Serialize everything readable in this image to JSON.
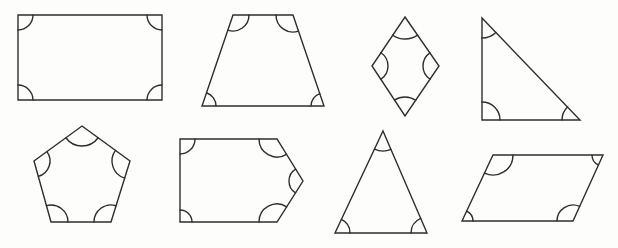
{
  "canvas": {
    "width": 618,
    "height": 248,
    "background": "#fdfdfb",
    "stroke_color": "#2e2e2e",
    "stroke_width": 1.4
  },
  "figure": {
    "shapes": [
      {
        "name": "rectangle",
        "sides": 4,
        "marked_angles": 4,
        "vertices": [
          [
            18,
            15
          ],
          [
            162,
            15
          ],
          [
            162,
            100
          ],
          [
            18,
            100
          ]
        ],
        "arc_radius": [
          15,
          15,
          15,
          15
        ]
      },
      {
        "name": "trapezoid",
        "sides": 4,
        "marked_angles": 4,
        "vertices": [
          [
            233,
            15
          ],
          [
            293,
            15
          ],
          [
            324,
            106
          ],
          [
            202,
            106
          ]
        ],
        "arc_radius": [
          16,
          17,
          13,
          14
        ]
      },
      {
        "name": "rhombus",
        "sides": 4,
        "marked_angles": 4,
        "vertices": [
          [
            405,
            17
          ],
          [
            439,
            66
          ],
          [
            405,
            116
          ],
          [
            372,
            66
          ]
        ],
        "arc_radius": [
          22,
          16,
          19,
          16
        ]
      },
      {
        "name": "right-triangle",
        "sides": 3,
        "marked_angles": 3,
        "vertices": [
          [
            482,
            18
          ],
          [
            580,
            120
          ],
          [
            482,
            120
          ]
        ],
        "arc_radius": [
          20,
          18,
          18
        ]
      },
      {
        "name": "pentagon",
        "sides": 5,
        "marked_angles": 5,
        "vertices": [
          [
            82,
            126
          ],
          [
            130,
            161
          ],
          [
            111,
            222
          ],
          [
            51,
            222
          ],
          [
            34,
            161
          ]
        ],
        "arc_radius": [
          20,
          18,
          17,
          17,
          16
        ]
      },
      {
        "name": "arrow-pentagon",
        "sides": 5,
        "marked_angles": 5,
        "vertices": [
          [
            180,
            139
          ],
          [
            277,
            139
          ],
          [
            303,
            181
          ],
          [
            277,
            222
          ],
          [
            180,
            222
          ]
        ],
        "arc_radius": [
          15,
          18,
          14,
          18,
          12
        ]
      },
      {
        "name": "isosceles-triangle",
        "sides": 3,
        "marked_angles": 3,
        "vertices": [
          [
            383,
            131
          ],
          [
            427,
            233
          ],
          [
            335,
            233
          ]
        ],
        "arc_radius": [
          20,
          16,
          15
        ]
      },
      {
        "name": "parallelogram",
        "sides": 4,
        "marked_angles": 4,
        "vertices": [
          [
            493,
            155
          ],
          [
            603,
            155
          ],
          [
            573,
            221
          ],
          [
            462,
            221
          ]
        ],
        "arc_radius": [
          20,
          11,
          16,
          11
        ]
      }
    ]
  }
}
